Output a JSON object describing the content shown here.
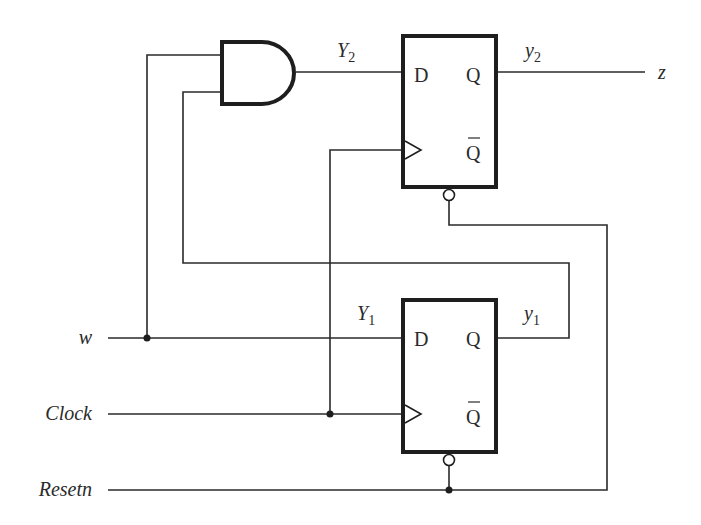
{
  "diagram": {
    "type": "sequential-circuit",
    "inputs": {
      "w": "w",
      "clock": "Clock",
      "resetn": "Resetn"
    },
    "outputs": {
      "z": "z"
    },
    "signals": {
      "Y2_main": "Y",
      "Y2_sub": "2",
      "y2_main": "y",
      "y2_sub": "2",
      "Y1_main": "Y",
      "Y1_sub": "1",
      "y1_main": "y",
      "y1_sub": "1"
    },
    "flipflop_top": {
      "d_label": "D",
      "q_label": "Q",
      "qbar_label": "Q"
    },
    "flipflop_bottom": {
      "d_label": "D",
      "q_label": "Q",
      "qbar_label": "Q"
    },
    "gates": [
      {
        "type": "AND",
        "inputs": [
          "w",
          "y1"
        ],
        "output": "Y2"
      }
    ],
    "colors": {
      "line": "#1e1e1e",
      "background": "#ffffff"
    }
  }
}
